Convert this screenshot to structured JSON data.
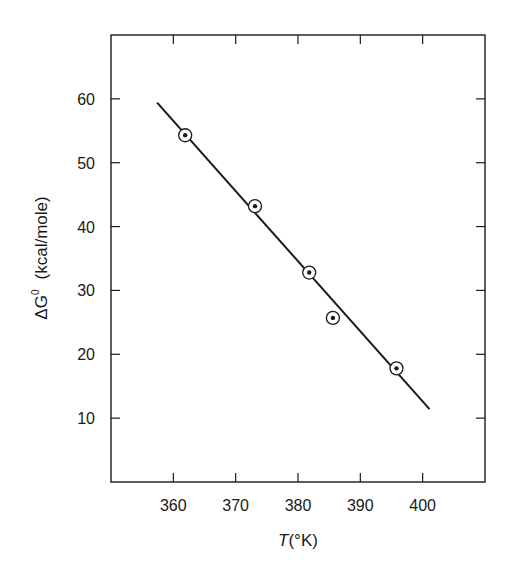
{
  "chart_data": {
    "type": "scatter",
    "title": "",
    "xlabel_var": "T",
    "xlabel_unit": "(°K)",
    "ylabel_var": "ΔG",
    "ylabel_sup": "0",
    "ylabel_unit": "(kcal/mole)",
    "xlim": [
      350,
      410
    ],
    "ylim": [
      0,
      70
    ],
    "x_ticks": [
      360,
      370,
      380,
      390,
      400
    ],
    "y_ticks": [
      10,
      20,
      30,
      40,
      50,
      60
    ],
    "x_tick_labels": [
      "360",
      "370",
      "380",
      "390",
      "400"
    ],
    "y_tick_labels": [
      "10",
      "20",
      "30",
      "40",
      "50",
      "60"
    ],
    "grid": false,
    "legend": "none",
    "series": [
      {
        "name": "measured",
        "marker": "circled-dot",
        "points": [
          {
            "x": 361.9,
            "y": 54.3
          },
          {
            "x": 373.1,
            "y": 43.2
          },
          {
            "x": 381.8,
            "y": 32.8
          },
          {
            "x": 385.6,
            "y": 25.7
          },
          {
            "x": 395.8,
            "y": 17.8
          }
        ]
      },
      {
        "name": "fit",
        "style": "line",
        "points": [
          {
            "x": 357.4,
            "y": 59.4
          },
          {
            "x": 401.1,
            "y": 11.4
          }
        ]
      }
    ]
  },
  "colors": {
    "ink": "#1a1a1a",
    "background": "#ffffff"
  }
}
